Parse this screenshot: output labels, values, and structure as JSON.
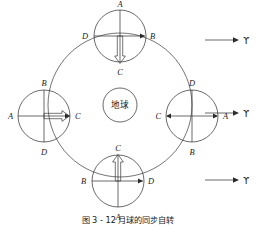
{
  "figure": {
    "title_cjk": "地球",
    "caption": "图 3 - 12   月球的同步自转",
    "center_body_label": "地球",
    "vernal_equinox_symbol": "ϒ",
    "colors": {
      "line": "#2b2b2b",
      "orbit": "#3a3a3a",
      "text": "#1a1a1a",
      "background": "#ffffff"
    }
  },
  "orbit": {
    "name": "moon-orbit-circle",
    "center_x": 120,
    "center_y": 105,
    "radius": 72
  },
  "earth": {
    "label": "地球",
    "center_x": 120,
    "center_y": 105,
    "radius": 17
  },
  "moons": [
    {
      "position": "top",
      "center_x": 120,
      "center_y": 36,
      "radius": 26,
      "labels": {
        "top": "A",
        "right": "B",
        "bottom": "C",
        "left": "D"
      },
      "thin_arrow": {
        "direction": "right",
        "toward": "B"
      },
      "hollow_arrow": {
        "direction": "down",
        "toward": "C"
      }
    },
    {
      "position": "left",
      "center_x": 44,
      "center_y": 116,
      "radius": 26,
      "labels": {
        "top": "B",
        "right": "C",
        "bottom": "D",
        "left": "A"
      },
      "thin_arrow": {
        "direction": "right",
        "toward": "C"
      },
      "hollow_arrow": {
        "direction": "right",
        "toward": "C"
      }
    },
    {
      "position": "right",
      "center_x": 192,
      "center_y": 116,
      "radius": 26,
      "labels": {
        "top": "D",
        "right": "A",
        "bottom": "B",
        "left": "C"
      },
      "thin_arrow": {
        "direction": "both",
        "toward": "C and A"
      },
      "hollow_arrow": null
    },
    {
      "position": "bottom",
      "center_x": 118,
      "center_y": 181,
      "radius": 26,
      "labels": {
        "top": "C",
        "right": "D",
        "bottom": "A",
        "left": "B"
      },
      "thin_arrow": {
        "direction": "right",
        "toward": "D"
      },
      "hollow_arrow": {
        "direction": "up",
        "toward": "C"
      }
    }
  ],
  "reference_arrows": [
    {
      "name": "reference-arrow-top",
      "y": 40,
      "x_start": 205,
      "x_end": 238,
      "label": "ϒ"
    },
    {
      "name": "reference-arrow-middle",
      "y": 113,
      "x_start": 205,
      "x_end": 238,
      "label": "ϒ"
    },
    {
      "name": "reference-arrow-bottom",
      "y": 180,
      "x_start": 205,
      "x_end": 238,
      "label": "ϒ"
    }
  ]
}
